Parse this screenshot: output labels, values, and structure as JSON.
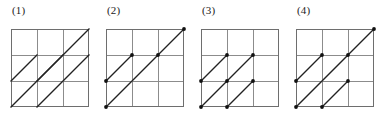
{
  "figure": {
    "type": "geometry-grid-diagram",
    "grid": {
      "rows": 3,
      "cols": 3,
      "cell_size": 26,
      "size": 78,
      "line_color": "#8c8c8c",
      "border_color": "#6e6e6e",
      "diagonal_color": "#222222",
      "dot_color": "#111111",
      "background": "#ffffff"
    },
    "panel_width": 95,
    "panel_left_offsets": [
      0,
      95,
      190,
      285
    ],
    "panels": [
      {
        "label": "(1)",
        "name": "panel-1",
        "diagonals": [
          {
            "x1": 0,
            "y1": 2,
            "x2": 1,
            "y2": 1
          },
          {
            "x1": 0,
            "y1": 3,
            "x2": 2,
            "y2": 1
          },
          {
            "x1": 1,
            "y1": 3,
            "x2": 3,
            "y2": 1
          },
          {
            "x1": 1,
            "y1": 2,
            "x2": 3,
            "y2": 0
          }
        ],
        "dots": []
      },
      {
        "label": "(2)",
        "name": "panel-2",
        "diagonals": [
          {
            "x1": 0,
            "y1": 2,
            "x2": 1,
            "y2": 1
          },
          {
            "x1": 0,
            "y1": 3,
            "x2": 3,
            "y2": 0
          }
        ],
        "dots": [
          {
            "x": 0,
            "y": 2
          },
          {
            "x": 1,
            "y": 1
          },
          {
            "x": 2,
            "y": 1
          },
          {
            "x": 3,
            "y": 0
          },
          {
            "x": 0,
            "y": 3
          }
        ]
      },
      {
        "label": "(3)",
        "name": "panel-3",
        "diagonals": [
          {
            "x1": 0,
            "y1": 2,
            "x2": 1,
            "y2": 1
          },
          {
            "x1": 0,
            "y1": 3,
            "x2": 2,
            "y2": 1
          },
          {
            "x1": 1,
            "y1": 3,
            "x2": 2,
            "y2": 2
          }
        ],
        "dots": [
          {
            "x": 0,
            "y": 2
          },
          {
            "x": 1,
            "y": 1
          },
          {
            "x": 2,
            "y": 1
          },
          {
            "x": 1,
            "y": 2
          },
          {
            "x": 2,
            "y": 2
          },
          {
            "x": 0,
            "y": 3
          },
          {
            "x": 1,
            "y": 3
          }
        ]
      },
      {
        "label": "(4)",
        "name": "panel-4",
        "diagonals": [
          {
            "x1": 0,
            "y1": 2,
            "x2": 1,
            "y2": 1
          },
          {
            "x1": 0,
            "y1": 3,
            "x2": 3,
            "y2": 0
          },
          {
            "x1": 1,
            "y1": 3,
            "x2": 2,
            "y2": 2
          }
        ],
        "dots": [
          {
            "x": 0,
            "y": 2
          },
          {
            "x": 1,
            "y": 1
          },
          {
            "x": 2,
            "y": 1
          },
          {
            "x": 3,
            "y": 0
          },
          {
            "x": 2,
            "y": 2
          },
          {
            "x": 0,
            "y": 3
          },
          {
            "x": 1,
            "y": 3
          }
        ]
      }
    ]
  }
}
